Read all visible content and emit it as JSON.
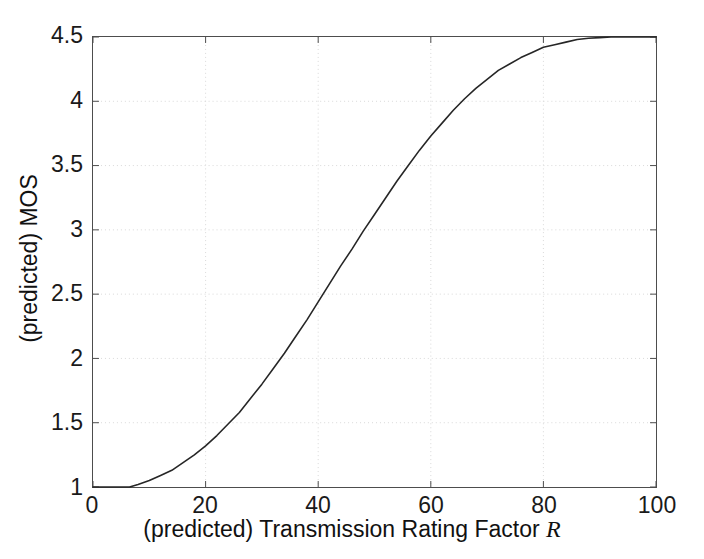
{
  "chart_data": {
    "type": "line",
    "title": "",
    "xlabel": "(predicted) Transmission Rating Factor R",
    "xlabel_plain": "(predicted) Transmission Rating Factor ",
    "xlabel_italic": "R",
    "ylabel": "(predicted) MOS",
    "xlim": [
      0,
      100
    ],
    "ylim": [
      1,
      4.5
    ],
    "xticks": [
      0,
      20,
      40,
      60,
      80,
      100
    ],
    "xtick_labels": [
      "0",
      "20",
      "40",
      "60",
      "80",
      "100"
    ],
    "yticks": [
      1,
      1.5,
      2,
      2.5,
      3,
      3.5,
      4,
      4.5
    ],
    "ytick_labels": [
      "1",
      "1.5",
      "2",
      "2.5",
      "3",
      "3.5",
      "4",
      "4.5"
    ],
    "grid": true,
    "grid_style": "dotted",
    "grid_color": "#d9d9d9",
    "legend": "none",
    "line_color": "#262626",
    "line_width": 1.6,
    "series": [
      {
        "name": "E-model MOS vs R",
        "x": [
          0,
          2,
          4,
          6,
          6.5,
          8,
          10,
          12,
          14,
          16,
          18,
          20,
          22,
          24,
          26,
          28,
          30,
          32,
          34,
          36,
          38,
          40,
          42,
          44,
          46,
          48,
          50,
          52,
          54,
          56,
          58,
          60,
          62,
          64,
          66,
          68,
          70,
          72,
          74,
          76,
          78,
          80,
          82,
          84,
          86,
          88,
          90,
          92,
          94,
          96,
          98,
          100
        ],
        "y": [
          1.0,
          1.0,
          1.0,
          1.0,
          1.0,
          1.02,
          1.05,
          1.09,
          1.13,
          1.19,
          1.25,
          1.32,
          1.4,
          1.49,
          1.58,
          1.69,
          1.8,
          1.92,
          2.04,
          2.17,
          2.3,
          2.44,
          2.58,
          2.72,
          2.85,
          2.99,
          3.12,
          3.25,
          3.38,
          3.5,
          3.62,
          3.73,
          3.83,
          3.93,
          4.02,
          4.1,
          4.17,
          4.24,
          4.29,
          4.34,
          4.38,
          4.42,
          4.44,
          4.46,
          4.48,
          4.49,
          4.495,
          4.5,
          4.5,
          4.5,
          4.5,
          4.5
        ]
      }
    ],
    "annotations": []
  }
}
